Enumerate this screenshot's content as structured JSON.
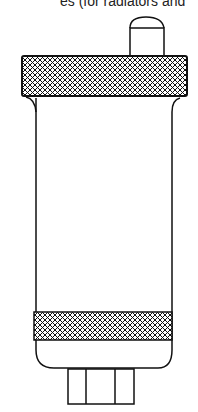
{
  "caption": "es (for radiators and",
  "diagram": {
    "parts": [
      "top-cap",
      "top-hatched-band",
      "body",
      "bottom-hatched-band",
      "base-connector"
    ],
    "stroke_color": "#111111",
    "hatch": "cross-hatch"
  }
}
